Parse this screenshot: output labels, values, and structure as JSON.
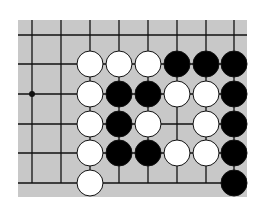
{
  "diagram": {
    "type": "go-board-fragment",
    "board_color": "#c8c8c8",
    "line_color": "#111111",
    "columns_x": [
      32,
      61,
      90,
      119,
      148,
      177,
      206,
      234
    ],
    "rows_y": [
      35,
      64,
      94,
      124,
      153,
      183
    ],
    "star_point": {
      "col": 0,
      "row": 2
    },
    "stone_radius": 13,
    "stones": [
      {
        "color": "white",
        "col": 2,
        "row": 1
      },
      {
        "color": "white",
        "col": 3,
        "row": 1
      },
      {
        "color": "white",
        "col": 4,
        "row": 1
      },
      {
        "color": "black",
        "col": 5,
        "row": 1
      },
      {
        "color": "black",
        "col": 6,
        "row": 1
      },
      {
        "color": "black",
        "col": 7,
        "row": 1
      },
      {
        "color": "white",
        "col": 2,
        "row": 2
      },
      {
        "color": "black",
        "col": 3,
        "row": 2
      },
      {
        "color": "black",
        "col": 4,
        "row": 2
      },
      {
        "color": "white",
        "col": 5,
        "row": 2
      },
      {
        "color": "white",
        "col": 6,
        "row": 2
      },
      {
        "color": "black",
        "col": 7,
        "row": 2
      },
      {
        "color": "white",
        "col": 2,
        "row": 3
      },
      {
        "color": "black",
        "col": 3,
        "row": 3
      },
      {
        "color": "white",
        "col": 4,
        "row": 3
      },
      {
        "color": "white",
        "col": 6,
        "row": 3
      },
      {
        "color": "black",
        "col": 7,
        "row": 3
      },
      {
        "color": "white",
        "col": 2,
        "row": 4
      },
      {
        "color": "black",
        "col": 3,
        "row": 4
      },
      {
        "color": "black",
        "col": 4,
        "row": 4
      },
      {
        "color": "white",
        "col": 5,
        "row": 4
      },
      {
        "color": "white",
        "col": 6,
        "row": 4
      },
      {
        "color": "black",
        "col": 7,
        "row": 4
      },
      {
        "color": "white",
        "col": 2,
        "row": 5
      },
      {
        "color": "black",
        "col": 7,
        "row": 5
      }
    ]
  }
}
